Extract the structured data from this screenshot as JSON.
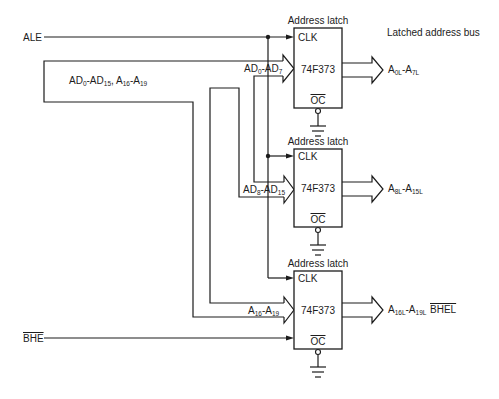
{
  "header": {
    "latched_bus_label": "Latched address bus"
  },
  "inputs": {
    "ale": "ALE",
    "bhe": "BHE",
    "multiplexed_bus": {
      "parts": [
        "AD",
        "0",
        "-AD",
        "15",
        ", A",
        "16",
        "-A",
        "19"
      ]
    }
  },
  "latches": [
    {
      "title": "Address latch",
      "clk": "CLK",
      "chip": "74F373",
      "oc": "OC",
      "in_bus": {
        "parts": [
          "AD",
          "0",
          "-AD",
          "7"
        ]
      },
      "out_bus": {
        "parts": [
          "A",
          "0L",
          "-A",
          "7L"
        ]
      }
    },
    {
      "title": "Address latch",
      "clk": "CLK",
      "chip": "74F373",
      "oc": "OC",
      "in_bus": {
        "parts": [
          "AD",
          "8",
          "-AD",
          "15"
        ]
      },
      "out_bus": {
        "parts": [
          "A",
          "8L",
          "-A",
          "15L"
        ]
      }
    },
    {
      "title": "Address latch",
      "clk": "CLK",
      "chip": "74F373",
      "oc": "OC",
      "in_bus": {
        "parts": [
          "A",
          "16",
          "-A",
          "19"
        ]
      },
      "out_bus": {
        "parts": [
          "A",
          "16L",
          "-A",
          "19L"
        ],
        "extra": "BHEL"
      }
    }
  ],
  "colors": {
    "line": "#1c1c1c",
    "background": "#ffffff"
  }
}
